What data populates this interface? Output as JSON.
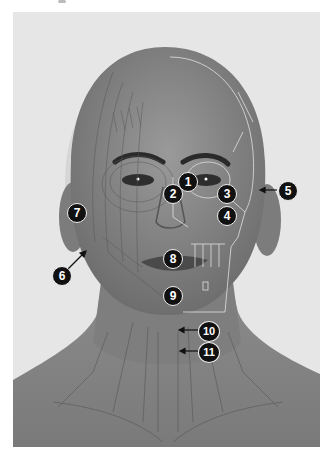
{
  "figure": {
    "colors": {
      "background": "#e6e6e6",
      "skin": "#8a8a8a",
      "label_fill": "#111111",
      "label_text": "#ffffff",
      "bone_outline": "#d8d8d8",
      "muscle_lines": "#5a5a5a"
    }
  },
  "labels": [
    {
      "id": "1",
      "text": "1",
      "arrow": false
    },
    {
      "id": "2",
      "text": "2",
      "arrow": false
    },
    {
      "id": "3",
      "text": "3",
      "arrow": false
    },
    {
      "id": "4",
      "text": "4",
      "arrow": false
    },
    {
      "id": "5",
      "text": "5",
      "arrow": true,
      "arrow_direction": "left"
    },
    {
      "id": "6",
      "text": "6",
      "arrow": true,
      "arrow_direction": "up-right"
    },
    {
      "id": "7",
      "text": "7",
      "arrow": false
    },
    {
      "id": "8",
      "text": "8",
      "arrow": false
    },
    {
      "id": "9",
      "text": "9",
      "arrow": false
    },
    {
      "id": "10",
      "text": "10",
      "arrow": true,
      "arrow_direction": "left"
    },
    {
      "id": "11",
      "text": "11",
      "arrow": true,
      "arrow_direction": "left"
    }
  ]
}
